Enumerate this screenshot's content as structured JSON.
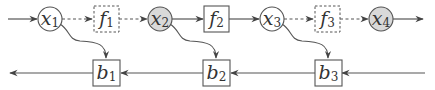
{
  "diagram": {
    "type": "computation-graph",
    "colors": {
      "stroke": "#555555",
      "observed_fill": "#d9d9d9",
      "node_fill": "#ffffff",
      "text": "#333333"
    },
    "forward_row": {
      "nodes": [
        {
          "id": "x1",
          "kind": "circle",
          "base": "x",
          "sub": "1",
          "shaded": false
        },
        {
          "id": "f1",
          "kind": "box",
          "base": "f",
          "sub": "1",
          "dashed": true
        },
        {
          "id": "x2",
          "kind": "circle",
          "base": "x",
          "sub": "2",
          "shaded": true
        },
        {
          "id": "f2",
          "kind": "box",
          "base": "f",
          "sub": "2",
          "dashed": false
        },
        {
          "id": "x3",
          "kind": "circle",
          "base": "x",
          "sub": "3",
          "shaded": false
        },
        {
          "id": "f3",
          "kind": "box",
          "base": "f",
          "sub": "3",
          "dashed": true
        },
        {
          "id": "x4",
          "kind": "circle",
          "base": "x",
          "sub": "4",
          "shaded": true
        }
      ],
      "edges": [
        {
          "from": "input",
          "to": "x1",
          "dashed": false
        },
        {
          "from": "x1",
          "to": "f1",
          "dashed": true
        },
        {
          "from": "f1",
          "to": "x2",
          "dashed": true
        },
        {
          "from": "x2",
          "to": "f2",
          "dashed": false
        },
        {
          "from": "f2",
          "to": "x3",
          "dashed": false
        },
        {
          "from": "x3",
          "to": "f3",
          "dashed": true
        },
        {
          "from": "f3",
          "to": "x4",
          "dashed": true
        },
        {
          "from": "x4",
          "to": "output",
          "dashed": false
        }
      ]
    },
    "backward_row": {
      "nodes": [
        {
          "id": "b1",
          "kind": "box",
          "base": "b",
          "sub": "1"
        },
        {
          "id": "b2",
          "kind": "box",
          "base": "b",
          "sub": "2"
        },
        {
          "id": "b3",
          "kind": "box",
          "base": "b",
          "sub": "3"
        }
      ],
      "edges": [
        {
          "from": "input",
          "to": "b3"
        },
        {
          "from": "b3",
          "to": "b2"
        },
        {
          "from": "b2",
          "to": "b1"
        },
        {
          "from": "b1",
          "to": "output"
        }
      ]
    },
    "cross_edges": [
      {
        "from": "x1",
        "to": "b1",
        "curved": true
      },
      {
        "from": "x2",
        "to": "b2",
        "curved": true
      },
      {
        "from": "x3",
        "to": "b3",
        "curved": true
      }
    ]
  }
}
